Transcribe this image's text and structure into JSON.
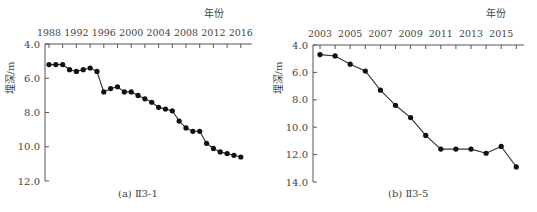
{
  "chart_data": [
    {
      "type": "line",
      "panel": "a",
      "caption": "(a) Ⅱ3-1",
      "title": "",
      "xlabel": "年份",
      "ylabel": "埋深/m",
      "x_ticks": [
        "1988",
        "1992",
        "1996",
        "2000",
        "2004",
        "2008",
        "2012",
        "2016"
      ],
      "y_ticks": [
        "4.0",
        "6.0",
        "8.0",
        "10.0",
        "12.0"
      ],
      "ylim": [
        4.0,
        12.0
      ],
      "y_inverted": true,
      "x_axis_position": "top",
      "grid": false,
      "x": [
        1988,
        1989,
        1990,
        1991,
        1992,
        1993,
        1994,
        1995,
        1996,
        1997,
        1998,
        1999,
        2000,
        2001,
        2002,
        2003,
        2004,
        2005,
        2006,
        2007,
        2008,
        2009,
        2010,
        2011,
        2012,
        2013,
        2014,
        2015,
        2016
      ],
      "values": [
        5.2,
        5.2,
        5.2,
        5.5,
        5.6,
        5.5,
        5.4,
        5.6,
        6.8,
        6.6,
        6.5,
        6.8,
        6.8,
        7.0,
        7.2,
        7.4,
        7.7,
        7.8,
        7.9,
        8.5,
        8.9,
        9.1,
        9.1,
        9.8,
        10.1,
        10.3,
        10.4,
        10.5,
        10.6
      ]
    },
    {
      "type": "line",
      "panel": "b",
      "caption": "(b) Ⅱ3-5",
      "title": "",
      "xlabel": "年份",
      "ylabel": "埋深/m",
      "x_ticks": [
        "2003",
        "2005",
        "2007",
        "2009",
        "2011",
        "2013",
        "2015"
      ],
      "y_ticks": [
        "4.0",
        "6.0",
        "8.0",
        "10.0",
        "12.0",
        "14.0"
      ],
      "ylim": [
        4.0,
        14.0
      ],
      "y_inverted": true,
      "x_axis_position": "top",
      "grid": false,
      "x": [
        2003,
        2004,
        2005,
        2006,
        2007,
        2008,
        2009,
        2010,
        2011,
        2012,
        2013,
        2014,
        2015,
        2016
      ],
      "values": [
        4.7,
        4.8,
        5.4,
        5.9,
        7.3,
        8.4,
        9.3,
        10.6,
        11.6,
        11.6,
        11.6,
        11.9,
        11.4,
        12.9
      ]
    }
  ],
  "colors": {
    "line": "#333333",
    "marker": "#111111",
    "axis": "#555555",
    "text": "#444444"
  }
}
